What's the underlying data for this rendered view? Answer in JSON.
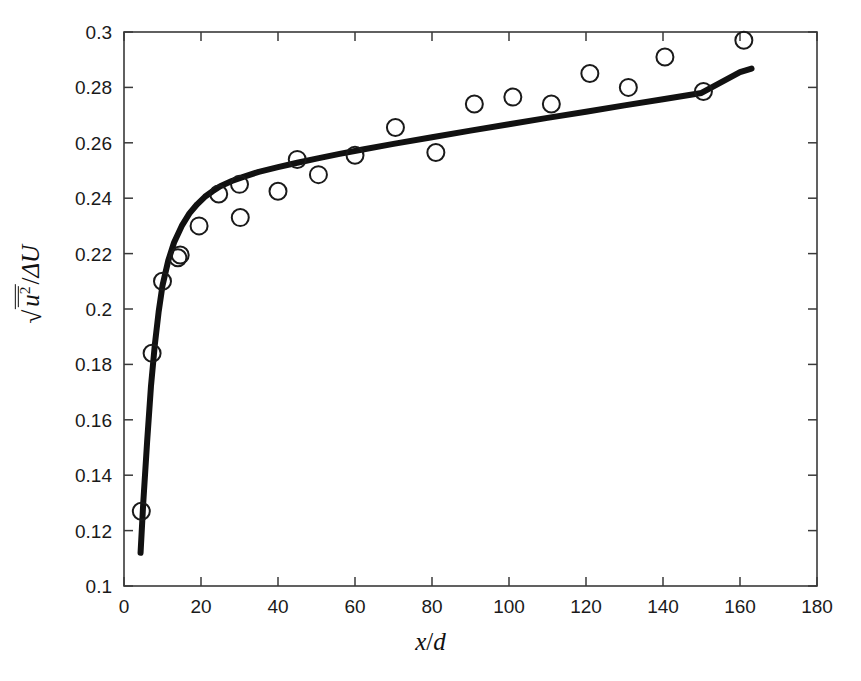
{
  "chart_data": {
    "type": "scatter",
    "title": "",
    "xlabel": "x/d",
    "ylabel": "sqrt(u^2 mean)/ΔU",
    "xlim": [
      0,
      180
    ],
    "ylim": [
      0.1,
      0.3
    ],
    "xticks": [
      0,
      20,
      40,
      60,
      80,
      100,
      120,
      140,
      160,
      180
    ],
    "xtick_labels": [
      "0",
      "20",
      "40",
      "60",
      "80",
      "100",
      "120",
      "140",
      "160",
      "180"
    ],
    "yticks": [
      0.1,
      0.12,
      0.14,
      0.16,
      0.18,
      0.2,
      0.22,
      0.24,
      0.26,
      0.28,
      0.3
    ],
    "ytick_labels": [
      "0.1",
      "0.12",
      "0.14",
      "0.16",
      "0.18",
      "0.2",
      "0.22",
      "0.24",
      "0.26",
      "0.28",
      "0.3"
    ],
    "grid": false,
    "legend": false,
    "series": [
      {
        "name": "experimental data",
        "marker": "open-circle",
        "color": "#1a1a1a",
        "x": [
          4.5,
          7.3,
          10.0,
          14.0,
          14.6,
          19.5,
          24.6,
          30.0,
          30.2,
          40.0,
          45.0,
          50.5,
          60.0,
          70.5,
          81.0,
          91.0,
          101.0,
          111.0,
          121.0,
          131.0,
          140.5,
          150.5,
          161.0
        ],
        "y": [
          0.127,
          0.184,
          0.21,
          0.2185,
          0.2195,
          0.23,
          0.2415,
          0.245,
          0.233,
          0.2425,
          0.254,
          0.2485,
          0.2555,
          0.2655,
          0.2565,
          0.274,
          0.2765,
          0.274,
          0.285,
          0.28,
          0.291,
          0.2785,
          0.297
        ]
      },
      {
        "name": "model curve",
        "marker": "none",
        "line": "solid",
        "color": "#111111",
        "x": [
          4.3,
          5.0,
          6.0,
          7.0,
          8.0,
          9.0,
          10.0,
          11.5,
          13.0,
          15.0,
          17.0,
          19.0,
          21.0,
          23.0,
          25.0,
          28.0,
          31.0,
          35.0,
          40.0,
          45.0,
          50.0,
          56.0,
          62.0,
          70.0,
          80.0,
          90.0,
          100.0,
          110.0,
          120.0,
          130.0,
          140.0,
          150.0,
          160.0,
          163.0
        ],
        "y": [
          0.112,
          0.13,
          0.152,
          0.172,
          0.187,
          0.199,
          0.2085,
          0.2175,
          0.224,
          0.23,
          0.2345,
          0.2378,
          0.2405,
          0.2425,
          0.2443,
          0.2462,
          0.2477,
          0.2495,
          0.2512,
          0.2528,
          0.2543,
          0.256,
          0.2576,
          0.2596,
          0.262,
          0.2644,
          0.2667,
          0.269,
          0.2712,
          0.2735,
          0.2757,
          0.278,
          0.2855,
          0.2868
        ]
      }
    ]
  },
  "axes": {
    "x_title_parts": {
      "num": "x",
      "den": "d"
    },
    "y_title_parts": {
      "radicand_base": "u",
      "radicand_exp": "2",
      "denominator": "ΔU"
    }
  }
}
